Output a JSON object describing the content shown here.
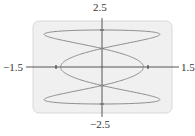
{
  "chart_data": {
    "type": "line",
    "title": "",
    "xlabel": "",
    "ylabel": "",
    "xlim": [
      -1.5,
      1.5
    ],
    "ylim": [
      -2.5,
      2.5
    ],
    "tick_labels": {
      "x_min": "−1.5",
      "x_max": "1.5",
      "y_min": "−2.5",
      "y_max": "2.5"
    },
    "x_ticks": [
      -1,
      1
    ],
    "y_ticks": [
      -2,
      -1,
      1,
      2
    ],
    "grid": false,
    "legend": null,
    "series": [
      {
        "name": "parametric curve",
        "parametric": "x = sin(3t)*(0.9 + 0.35*(y/1.73)^2), y = 2cos(t), 0 <= t <= 2pi",
        "key_points": [
          {
            "x": 0,
            "y": 2
          },
          {
            "x": 1.25,
            "y": 1.73
          },
          {
            "x": -1.25,
            "y": 1.73
          },
          {
            "x": 0,
            "y": 1
          },
          {
            "x": 0.9,
            "y": 0
          },
          {
            "x": -0.9,
            "y": 0
          },
          {
            "x": 0,
            "y": -1
          },
          {
            "x": 1.25,
            "y": -1.73
          },
          {
            "x": -1.25,
            "y": -1.73
          },
          {
            "x": 0,
            "y": -2
          }
        ],
        "color": "#888888"
      }
    ]
  },
  "colors": {
    "panel_fill": "#f0f0f0",
    "panel_border": "#d8d8d8",
    "axis": "#444444",
    "curve": "#8a8a8a"
  }
}
